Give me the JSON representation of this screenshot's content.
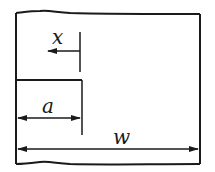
{
  "diagram": {
    "title": "",
    "type": "edge-crack specimen schematic",
    "colors": {
      "stroke": "#1a1a1a",
      "background": "#ffffff"
    },
    "labels": {
      "x": "x",
      "a": "a",
      "w": "w"
    },
    "dimensions": [
      {
        "name": "x",
        "description": "coordinate measured leftward from crack tip"
      },
      {
        "name": "a",
        "description": "crack length"
      },
      {
        "name": "w",
        "description": "specimen width"
      }
    ]
  }
}
